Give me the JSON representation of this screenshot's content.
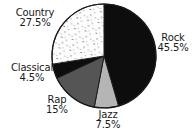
{
  "chart_data": {
    "type": "pie",
    "title": "",
    "subtitle": "",
    "xlabel": "",
    "ylabel": "",
    "legend_position": "none",
    "grid": false,
    "start_angle_deg": 0,
    "direction": "clockwise",
    "categories": [
      "Rock",
      "Jazz",
      "Rap",
      "Classical",
      "Country"
    ],
    "values": [
      45.5,
      7.5,
      15,
      4.5,
      27.5
    ],
    "labels": [
      "Rock",
      "Jazz",
      "Rap",
      "Classical",
      "Country"
    ],
    "value_labels": [
      "45.5%",
      "7.5%",
      "15%",
      "4.5%",
      "27.5%"
    ],
    "colors": [
      "#0d0d0d",
      "#b5b5b5",
      "#555555",
      "#0d0d0d",
      "#fdfdfd"
    ],
    "slices": [
      {
        "name": "Rock",
        "percent_label": "45.5%",
        "value": 45.5,
        "color": "#0d0d0d",
        "fill_style": "solid-black"
      },
      {
        "name": "Jazz",
        "percent_label": "7.5%",
        "value": 7.5,
        "color": "#b5b5b5",
        "fill_style": "solid-light-gray"
      },
      {
        "name": "Rap",
        "percent_label": "15%",
        "value": 15,
        "color": "#555555",
        "fill_style": "solid-dark-gray"
      },
      {
        "name": "Classical",
        "percent_label": "4.5%",
        "value": 4.5,
        "color": "#0d0d0d",
        "fill_style": "solid-black"
      },
      {
        "name": "Country",
        "percent_label": "27.5%",
        "value": 27.5,
        "color": "#fdfdfd",
        "fill_style": "white-speckled"
      }
    ],
    "total_percent": 100
  },
  "colors": {
    "background": "#ffffff",
    "outline": "#1a1a1a",
    "text": "#1a1a1a",
    "black_slice": "#0d0d0d",
    "dark_gray_slice": "#555555",
    "light_gray_slice": "#b5b5b5",
    "white_slice": "#fdfdfd",
    "speckle": "#8a8a8a"
  }
}
